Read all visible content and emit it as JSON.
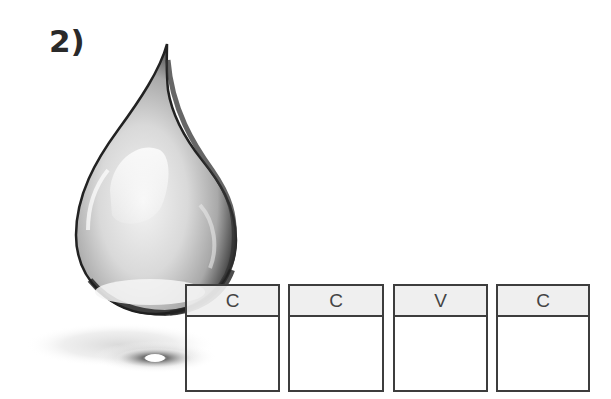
{
  "exercise": {
    "number_label": "2)",
    "image_subject": "water drop",
    "icon": "water-drop-icon"
  },
  "letter_boxes": [
    {
      "header": "C",
      "answer": ""
    },
    {
      "header": "C",
      "answer": ""
    },
    {
      "header": "V",
      "answer": ""
    },
    {
      "header": "C",
      "answer": ""
    }
  ],
  "colors": {
    "outline": "#3d3d3d",
    "header_fill": "#efefef",
    "text": "#2a2a2a"
  }
}
